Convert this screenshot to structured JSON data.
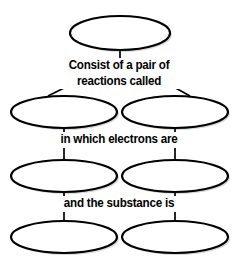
{
  "diagram": {
    "type": "concept-map",
    "topic_hint": "redox reaction graphic organizer",
    "nodes": [
      {
        "id": "node-top",
        "label": "",
        "row": 0,
        "column": "center"
      },
      {
        "id": "node-row2-left",
        "label": "",
        "row": 1,
        "column": "left"
      },
      {
        "id": "node-row2-right",
        "label": "",
        "row": 1,
        "column": "right"
      },
      {
        "id": "node-row3-left",
        "label": "",
        "row": 2,
        "column": "left"
      },
      {
        "id": "node-row3-right",
        "label": "",
        "row": 2,
        "column": "right"
      },
      {
        "id": "node-row4-left",
        "label": "",
        "row": 3,
        "column": "left"
      },
      {
        "id": "node-row4-right",
        "label": "",
        "row": 3,
        "column": "right"
      }
    ],
    "link_labels": {
      "pair_line1": "Consist of a pair of",
      "pair_line2": "reactions called",
      "electrons": "in which electrons are",
      "substance": "and the substance is"
    },
    "colors": {
      "stroke": "#000000",
      "fill": "#ffffff",
      "text": "#000000",
      "shadow": "#b9b9b9",
      "background": "#ffffff"
    }
  }
}
